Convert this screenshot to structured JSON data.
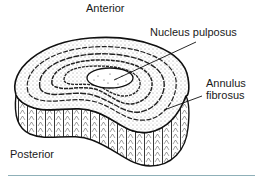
{
  "diagram": {
    "labels": {
      "anterior": "Anterior",
      "posterior": "Posterior",
      "nucleus": "Nucleus pulposus",
      "annulus_line1": "Annulus",
      "annulus_line2": "fibrosus"
    },
    "colors": {
      "ink": "#1a1a1a",
      "rule": "#8fb0b8"
    }
  }
}
